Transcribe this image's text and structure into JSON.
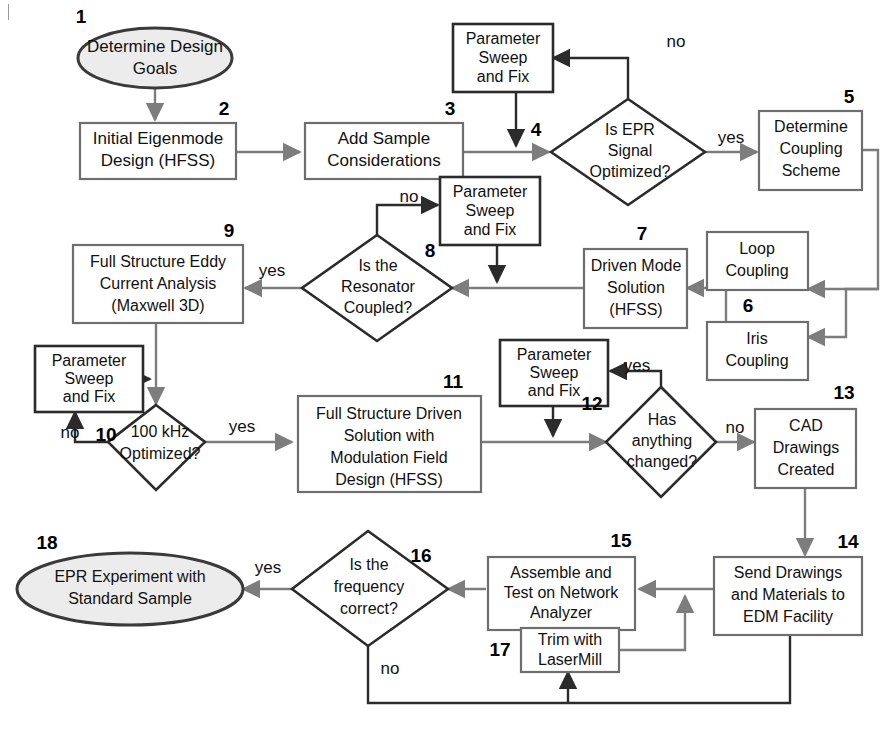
{
  "figure": {
    "type": "flowchart",
    "background": "#ffffff",
    "colors": {
      "terminator_fill": "#ececec",
      "terminator_stroke": "#3a3a3a",
      "process_stroke_gray": "#6e6e6e",
      "process_stroke_dark": "#2b2b2b",
      "decision_stroke": "#2b2b2b",
      "connector_gray": "#7d7d7d",
      "connector_dark": "#2b2b2b",
      "text": "#111111"
    }
  },
  "nodes": [
    {
      "id": "n1",
      "num": "1",
      "shape": "ellipse",
      "lines": [
        "Determine Design",
        "Goals"
      ]
    },
    {
      "id": "n2",
      "num": "2",
      "shape": "process",
      "lines": [
        "Initial Eigenmode",
        "Design (HFSS)"
      ]
    },
    {
      "id": "n3",
      "num": "3",
      "shape": "process",
      "lines": [
        "Add Sample",
        "Considerations"
      ]
    },
    {
      "id": "ps1",
      "num": "",
      "shape": "process",
      "lines": [
        "Parameter",
        "Sweep",
        "and Fix"
      ]
    },
    {
      "id": "n4",
      "num": "4",
      "shape": "decision",
      "lines": [
        "Is EPR",
        "Signal",
        "Optimized?"
      ]
    },
    {
      "id": "n5",
      "num": "5",
      "shape": "process",
      "lines": [
        "Determine",
        "Coupling",
        "Scheme"
      ]
    },
    {
      "id": "n6a",
      "num": "",
      "shape": "process",
      "lines": [
        "Loop",
        "Coupling"
      ]
    },
    {
      "id": "n6b",
      "num": "6",
      "shape": "process",
      "lines": [
        "Iris",
        "Coupling"
      ]
    },
    {
      "id": "n7",
      "num": "7",
      "shape": "process",
      "lines": [
        "Driven Mode",
        "Solution",
        "(HFSS)"
      ]
    },
    {
      "id": "ps2",
      "num": "",
      "shape": "process",
      "lines": [
        "Parameter",
        "Sweep",
        "and Fix"
      ]
    },
    {
      "id": "n8",
      "num": "8",
      "shape": "decision",
      "lines": [
        "Is the",
        "Resonator",
        "Coupled?"
      ]
    },
    {
      "id": "n9",
      "num": "9",
      "shape": "process",
      "lines": [
        "Full Structure Eddy",
        "Current Analysis",
        "(Maxwell 3D)"
      ]
    },
    {
      "id": "ps3",
      "num": "",
      "shape": "process",
      "lines": [
        "Parameter",
        "Sweep",
        "and Fix"
      ]
    },
    {
      "id": "n10",
      "num": "10",
      "shape": "decision",
      "lines": [
        "100 kHz",
        "Optimized?"
      ]
    },
    {
      "id": "n11",
      "num": "11",
      "shape": "process",
      "lines": [
        "Full Structure Driven",
        "Solution with",
        "Modulation Field",
        "Design (HFSS)"
      ]
    },
    {
      "id": "ps4",
      "num": "",
      "shape": "process",
      "lines": [
        "Parameter",
        "Sweep",
        "and Fix"
      ]
    },
    {
      "id": "n12",
      "num": "12",
      "shape": "decision",
      "lines": [
        "Has",
        "anything",
        "changed?"
      ]
    },
    {
      "id": "n13",
      "num": "13",
      "shape": "process",
      "lines": [
        "CAD",
        "Drawings",
        "Created"
      ]
    },
    {
      "id": "n14",
      "num": "14",
      "shape": "process",
      "lines": [
        "Send Drawings",
        "and Materials to",
        "EDM Facility"
      ]
    },
    {
      "id": "n15",
      "num": "15",
      "shape": "process",
      "lines": [
        "Assemble and",
        "Test on Network",
        "Analyzer"
      ]
    },
    {
      "id": "n16",
      "num": "16",
      "shape": "decision",
      "lines": [
        "Is the",
        "frequency",
        "correct?"
      ]
    },
    {
      "id": "n17",
      "num": "17",
      "shape": "process",
      "lines": [
        "Trim with",
        "LaserMill"
      ]
    },
    {
      "id": "n18",
      "num": "18",
      "shape": "ellipse",
      "lines": [
        "EPR Experiment with",
        "Standard Sample"
      ]
    }
  ],
  "edge_labels": {
    "no_4": "no",
    "yes_4": "yes",
    "no_8": "no",
    "yes_8": "yes",
    "no_10": "no",
    "yes_10": "yes",
    "yes_12": "yes",
    "no_12": "no",
    "yes_16": "yes",
    "no_16": "no"
  },
  "step_numbers": [
    "1",
    "2",
    "3",
    "4",
    "5",
    "6",
    "7",
    "8",
    "9",
    "10",
    "11",
    "12",
    "13",
    "14",
    "15",
    "16",
    "17",
    "18"
  ],
  "text": {
    "n1_l1": "Determine Design",
    "n1_l2": "Goals",
    "n2_l1": "Initial Eigenmode",
    "n2_l2": "Design (HFSS)",
    "n3_l1": "Add Sample",
    "n3_l2": "Considerations",
    "ps_l1": "Parameter",
    "ps_l2": "Sweep",
    "ps_l3": "and Fix",
    "n4_l1": "Is EPR",
    "n4_l2": "Signal",
    "n4_l3": "Optimized?",
    "n5_l1": "Determine",
    "n5_l2": "Coupling",
    "n5_l3": "Scheme",
    "n6a_l1": "Loop",
    "n6a_l2": "Coupling",
    "n6b_l1": "Iris",
    "n6b_l2": "Coupling",
    "n7_l1": "Driven Mode",
    "n7_l2": "Solution",
    "n7_l3": "(HFSS)",
    "n8_l1": "Is the",
    "n8_l2": "Resonator",
    "n8_l3": "Coupled?",
    "n9_l1": "Full Structure Eddy",
    "n9_l2": "Current Analysis",
    "n9_l3": "(Maxwell 3D)",
    "n10_l1": "100 kHz",
    "n10_l2": "Optimized?",
    "n11_l1": "Full Structure Driven",
    "n11_l2": "Solution with",
    "n11_l3": "Modulation Field",
    "n11_l4": "Design (HFSS)",
    "n12_l1": "Has",
    "n12_l2": "anything",
    "n12_l3": "changed?",
    "n13_l1": "CAD",
    "n13_l2": "Drawings",
    "n13_l3": "Created",
    "n14_l1": "Send Drawings",
    "n14_l2": "and Materials to",
    "n14_l3": "EDM Facility",
    "n15_l1": "Assemble and",
    "n15_l2": "Test on Network",
    "n15_l3": "Analyzer",
    "n16_l1": "Is the",
    "n16_l2": "frequency",
    "n16_l3": "correct?",
    "n17_l1": "Trim with",
    "n17_l2": "LaserMill",
    "n18_l1": "EPR Experiment with",
    "n18_l2": "Standard Sample"
  }
}
